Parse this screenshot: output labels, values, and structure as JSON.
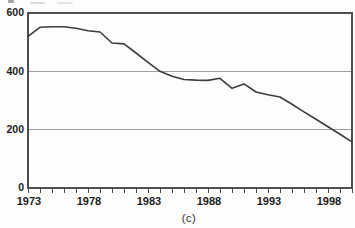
{
  "figure": {
    "caption": "(c)"
  },
  "chart_data": {
    "type": "line",
    "title": "",
    "xlabel": "",
    "ylabel": "",
    "x": [
      1973,
      1974,
      1975,
      1976,
      1977,
      1978,
      1979,
      1980,
      1981,
      1982,
      1983,
      1984,
      1985,
      1986,
      1987,
      1988,
      1989,
      1990,
      1991,
      1992,
      1993,
      1994,
      1995,
      1996,
      1997,
      1998,
      1999,
      2000
    ],
    "series": [
      {
        "name": "value",
        "values": [
          520,
          551,
          553,
          553,
          548,
          539,
          535,
          497,
          494,
          463,
          431,
          400,
          383,
          372,
          370,
          369,
          376,
          342,
          357,
          329,
          320,
          312,
          287,
          261,
          236,
          210,
          184,
          158
        ]
      }
    ],
    "xlim": [
      1973,
      2000
    ],
    "ylim": [
      0,
      600
    ],
    "y_ticks": [
      0,
      200,
      400,
      600
    ],
    "x_tick_labels": [
      1973,
      1978,
      1983,
      1988,
      1993,
      1998
    ],
    "x_minor_tick_interval": 1,
    "grid": "horizontal",
    "legend": "none",
    "line_color": "#3d3d3d",
    "grid_color": "#9e9e9e",
    "axis_color": "#4f4f4f",
    "text_color": "#1c1c1c"
  }
}
